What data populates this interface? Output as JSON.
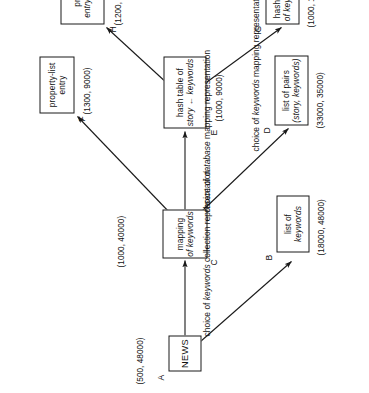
{
  "figure": {
    "type": "refinement-tree-diagram",
    "orientation": "rotated-90-ccw",
    "background": "#ffffff",
    "ink_color": "#111111"
  },
  "nodes": [
    {
      "id": "A",
      "name": "news",
      "lines": [
        "NEWS"
      ],
      "italic_lines": [],
      "cost": "(500, 48000)"
    },
    {
      "id": "B",
      "name": "list-of-keywords",
      "lines": [
        "list of",
        "keywords"
      ],
      "italic_lines": [
        1
      ],
      "cost": "(18000, 48000)"
    },
    {
      "id": "C",
      "name": "mapping-of-keywords",
      "lines": [
        "mapping",
        "of keywords"
      ],
      "italic_lines": [
        1
      ],
      "cost": "(1000, 40000)"
    },
    {
      "id": "D",
      "name": "list-of-pairs",
      "lines": [
        "list of pairs",
        "(story, keywords)"
      ],
      "italic_lines": [
        1
      ],
      "cost": "(33000, 35000)"
    },
    {
      "id": "E",
      "name": "hash-table-story-keywords",
      "lines": [
        "hash table of",
        "story ← keywords"
      ],
      "italic_lines": [
        1
      ],
      "cost": "(1000, 9000)"
    },
    {
      "id": "F",
      "name": "property-list-entry",
      "lines": [
        "property-list",
        "entry"
      ],
      "italic_lines": [],
      "cost": "(1300, 9000)"
    },
    {
      "id": "G",
      "name": "hash-table-of-keywords",
      "lines": [
        "hash table",
        "of keywords"
      ],
      "italic_lines": [
        1
      ],
      "cost": "(1000, 1000)"
    },
    {
      "id": "H",
      "name": "property-list-entry-of-keywords",
      "lines": [
        "property-list",
        "entry of keywords"
      ],
      "italic_lines": [
        1
      ],
      "cost": "(1200, 1200)"
    }
  ],
  "edge_labels": [
    {
      "name": "keywords-collection-representation",
      "prefix": "choice of ",
      "emphasis": "keywords",
      "suffix": " collection representation"
    },
    {
      "name": "database-mapping-representation",
      "prefix": "choice of ",
      "emphasis": "database",
      "suffix": " mapping representation"
    },
    {
      "name": "keywords-mapping-representation",
      "prefix": "choice of ",
      "emphasis": "keywords",
      "suffix": " mapping representation"
    }
  ],
  "edges": [
    {
      "from": "A",
      "to": "C",
      "group": "keywords-collection-representation"
    },
    {
      "from": "A",
      "to": "B",
      "group": "keywords-collection-representation"
    },
    {
      "from": "C",
      "to": "F",
      "group": "database-mapping-representation"
    },
    {
      "from": "C",
      "to": "E",
      "group": "database-mapping-representation"
    },
    {
      "from": "C",
      "to": "D",
      "group": "database-mapping-representation"
    },
    {
      "from": "E",
      "to": "H",
      "group": "keywords-mapping-representation"
    },
    {
      "from": "E",
      "to": "G",
      "group": "keywords-mapping-representation"
    }
  ]
}
